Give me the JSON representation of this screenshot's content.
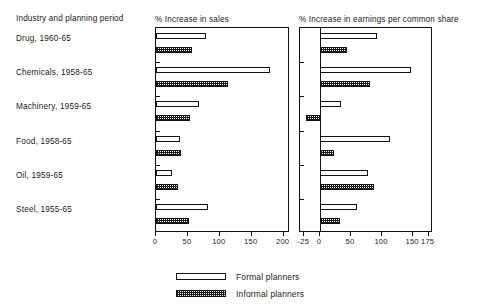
{
  "figure": {
    "label_column_header": "Industry and planning period",
    "row_labels": [
      "Drug, 1960-65",
      "Chemicals, 1958-65",
      "Machinery, 1959-65",
      "Food, 1958-65",
      "Oil, 1959-65",
      "Steel, 1955-65"
    ],
    "legend": [
      {
        "key": "formal",
        "label": "Formal planners"
      },
      {
        "key": "informal",
        "label": "Informal planners"
      }
    ]
  },
  "chart_data": [
    {
      "id": "sales",
      "type": "bar",
      "orientation": "horizontal",
      "title": "% Increase in sales",
      "xlabel": "% Increase in sales",
      "ylabel": "Industry and planning period",
      "categories": [
        "Drug, 1960-65",
        "Chemicals, 1958-65",
        "Machinery, 1959-65",
        "Food, 1958-65",
        "Oil, 1959-65",
        "Steel, 1955-65"
      ],
      "series": [
        {
          "name": "Formal planners",
          "values": [
            78,
            178,
            68,
            38,
            25,
            82
          ]
        },
        {
          "name": "Informal planners",
          "values": [
            57,
            113,
            53,
            39,
            35,
            52
          ]
        }
      ],
      "xlim": [
        0,
        210
      ],
      "xticks": [
        0,
        50,
        100,
        150,
        200
      ],
      "xtick_labels": [
        "0",
        "50",
        "100",
        "150",
        "200"
      ],
      "grid": false,
      "legend_position": "bottom"
    },
    {
      "id": "earnings",
      "type": "bar",
      "orientation": "horizontal",
      "title": "% Increase in earnings per common share",
      "xlabel": "% Increase in earnings per common share",
      "ylabel": "Industry and planning period",
      "categories": [
        "Drug, 1960-65",
        "Chemicals, 1958-65",
        "Machinery, 1959-65",
        "Food, 1958-65",
        "Oil, 1959-65",
        "Steel, 1955-65"
      ],
      "series": [
        {
          "name": "Formal planners",
          "values": [
            92,
            146,
            34,
            113,
            77,
            60
          ]
        },
        {
          "name": "Informal planners",
          "values": [
            44,
            80,
            -22,
            23,
            87,
            33
          ]
        }
      ],
      "xlim": [
        -32,
        182
      ],
      "xticks": [
        -25,
        0,
        50,
        100,
        150,
        175
      ],
      "xtick_labels": [
        "-25",
        "0",
        "50",
        "100",
        "150",
        "175"
      ],
      "grid": false,
      "legend_position": "bottom"
    }
  ]
}
